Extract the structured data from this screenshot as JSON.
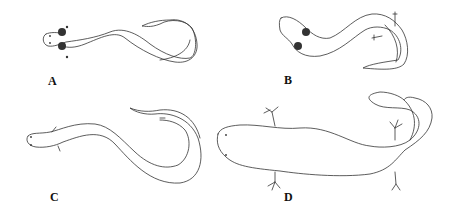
{
  "figure": {
    "panels": [
      {
        "id": "A",
        "label": "A",
        "subject": "elongate salamander, dorsal view, external gills"
      },
      {
        "id": "B",
        "label": "B",
        "subject": "elongate salamander, dorsal view, gills and small limbs"
      },
      {
        "id": "C",
        "label": "C",
        "subject": "elongate salamander, dorsal view, tiny limbs"
      },
      {
        "id": "D",
        "label": "D",
        "subject": "salamander, dorsal view, four limbs with digits"
      }
    ]
  }
}
